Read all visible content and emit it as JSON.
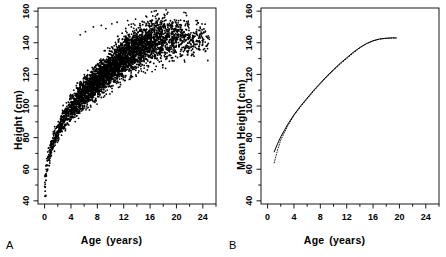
{
  "figure": {
    "width": 446,
    "height": 257,
    "background": "#ffffff",
    "ink": "#000000"
  },
  "panels": [
    {
      "id": "A",
      "letter": "A",
      "xlabel_part1": "Age",
      "xlabel_part2": "(years)",
      "ylabel": "Height  (cm)"
    },
    {
      "id": "B",
      "letter": "B",
      "xlabel_part1": "Age",
      "xlabel_part2": "(years)",
      "ylabel": "Mean Height  (cm)"
    }
  ],
  "chart_data": [
    {
      "type": "scatter",
      "panel": "A",
      "title": "",
      "xlabel": "Age (years)",
      "ylabel": "Height (cm)",
      "xlim": [
        -1,
        26
      ],
      "ylim": [
        38,
        162
      ],
      "xticks": [
        0,
        4,
        8,
        12,
        16,
        20,
        24
      ],
      "xminor_step": 2,
      "yticks": [
        40,
        60,
        80,
        100,
        120,
        140,
        160
      ],
      "yminor_step": 10,
      "grid": false,
      "legend": "none",
      "marker": "filled-circle",
      "marker_color": "#000000",
      "marker_size_px": 1.3,
      "n_points_approx": 4200,
      "description": "Dense scatter of individual height measurements versus age showing a saturating growth curve; rapid rise from ~45 cm at age 0 to ~100 cm by age 4, then a slower climb toward a plateau near 140-145 cm after age 16, with increasing vertical spread at older ages.",
      "median_curve": {
        "x": [
          0,
          0.25,
          0.5,
          1,
          1.5,
          2,
          3,
          4,
          5,
          6,
          7,
          8,
          9,
          10,
          11,
          12,
          13,
          14,
          15,
          16,
          17,
          18,
          19,
          20,
          22,
          24,
          25
        ],
        "y": [
          50,
          58,
          65,
          73,
          79,
          84,
          92,
          98,
          103,
          108,
          112,
          116,
          120,
          124,
          127,
          131,
          134,
          137,
          139,
          141,
          142,
          142.5,
          143,
          143,
          142.5,
          142,
          141.5
        ]
      },
      "spread_sd": {
        "x": [
          0,
          0.5,
          1,
          2,
          4,
          6,
          8,
          10,
          12,
          14,
          16,
          18,
          20,
          22,
          24,
          25
        ],
        "y": [
          3.0,
          3.0,
          3.2,
          3.6,
          4.2,
          4.6,
          5.2,
          5.8,
          6.4,
          6.8,
          7.0,
          7.2,
          6.8,
          6.2,
          5.6,
          5.4
        ]
      },
      "density_profile": {
        "note": "Point density peaks between ages 8 and 14 where the cloud is nearly solid black; sparse beyond age 20.",
        "x": [
          0,
          1,
          2,
          4,
          6,
          8,
          10,
          12,
          14,
          16,
          18,
          20,
          22,
          24,
          25
        ],
        "weight": [
          0.3,
          0.26,
          0.3,
          0.55,
          0.75,
          0.95,
          1.0,
          1.0,
          0.92,
          0.7,
          0.52,
          0.34,
          0.22,
          0.14,
          0.08
        ]
      }
    },
    {
      "type": "line",
      "panel": "B",
      "title": "",
      "xlabel": "Age (years)",
      "ylabel": "Mean Height (cm)",
      "xlim": [
        -1,
        26
      ],
      "ylim": [
        38,
        162
      ],
      "xticks": [
        0,
        4,
        8,
        12,
        16,
        20,
        24
      ],
      "xminor_step": 2,
      "yticks": [
        40,
        60,
        80,
        100,
        120,
        140,
        160
      ],
      "yminor_step": 10,
      "grid": false,
      "legend": "none",
      "x": [
        1,
        1.5,
        2,
        3,
        4,
        5,
        6,
        7,
        8,
        9,
        10,
        11,
        12,
        13,
        14,
        15,
        16,
        17,
        18,
        19,
        19.5
      ],
      "series": [
        {
          "name": "solid-curve",
          "style": "solid",
          "color": "#000000",
          "values": [
            71,
            76,
            80.5,
            88,
            94.5,
            100,
            105,
            110,
            114.5,
            119,
            123,
            127,
            130.5,
            134,
            137,
            139.5,
            141.3,
            142.4,
            142.9,
            143.1,
            143.1
          ]
        },
        {
          "name": "dotted-curve",
          "style": "dotted",
          "color": "#000000",
          "values": [
            64,
            72,
            78.5,
            87,
            94,
            99.5,
            104.5,
            109.5,
            114,
            118.5,
            122.5,
            126.5,
            130,
            133.5,
            136.8,
            139.4,
            141.2,
            142.3,
            142.8,
            143.0,
            143.0
          ]
        }
      ],
      "description": "Two almost coincident monotonically increasing concave curves (one solid, one dotted) of mean height versus age, rising from about 64-71 cm at age 1 to a plateau near 143 cm at age 19-20; the curves diverge only at the youngest ages."
    }
  ]
}
